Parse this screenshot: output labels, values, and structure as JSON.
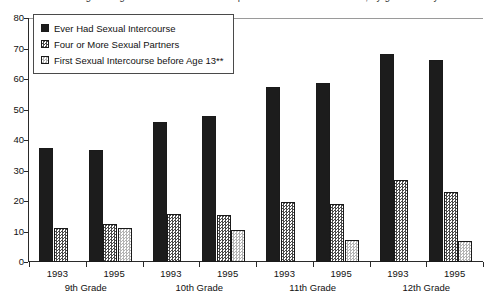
{
  "chart_data": {
    "type": "bar",
    "title": "Percentage of high school students who reported sexual risk behaviors, by grade and year",
    "subtitle": "",
    "xlabel": "",
    "ylabel": "",
    "ylim": [
      0,
      80
    ],
    "yticks": [
      0,
      10,
      20,
      30,
      40,
      50,
      60,
      70,
      80
    ],
    "grid": false,
    "legend_position": "upper-left-inside",
    "categories": [
      "1993 / 9th Grade",
      "1995 / 9th Grade",
      "1993 / 10th Grade",
      "1995 / 10th Grade",
      "1993 / 11th Grade",
      "1995 / 11th Grade",
      "1993 / 12th Grade",
      "1995 / 12th Grade"
    ],
    "series": [
      {
        "name": "Ever Had Sexual Intercourse",
        "color": "#1c1c1c",
        "values": [
          37.5,
          36.8,
          46.0,
          48.0,
          57.5,
          58.6,
          68.3,
          66.3
        ]
      },
      {
        "name": "Four or More Sexual Partners",
        "color": "#4a4a4a",
        "values": [
          11.0,
          12.5,
          15.8,
          15.5,
          19.8,
          19.0,
          27.0,
          22.8
        ]
      },
      {
        "name": "First Sexual Intercourse before Age 13**",
        "color": "#b4b4b4",
        "values": [
          null,
          11.0,
          null,
          10.5,
          null,
          7.2,
          null,
          6.8
        ]
      }
    ],
    "groups": [
      {
        "year": "1993",
        "grade": "9th Grade"
      },
      {
        "year": "1995",
        "grade": "9th Grade"
      },
      {
        "year": "1993",
        "grade": "10th Grade"
      },
      {
        "year": "1995",
        "grade": "10th Grade"
      },
      {
        "year": "1993",
        "grade": "11th Grade"
      },
      {
        "year": "1995",
        "grade": "11th Grade"
      },
      {
        "year": "1993",
        "grade": "12th Grade"
      },
      {
        "year": "1995",
        "grade": "12th Grade"
      }
    ],
    "grade_labels": [
      "9th Grade",
      "10th Grade",
      "11th Grade",
      "12th Grade"
    ],
    "year_labels": [
      "1993",
      "1995",
      "1993",
      "1995",
      "1993",
      "1995",
      "1993",
      "1995"
    ]
  },
  "legend": {
    "items": [
      {
        "label": "Ever Had Sexual Intercourse",
        "swatch": "solid-black-swatch"
      },
      {
        "label": "Four or More Sexual Partners",
        "swatch": "dark-checker-swatch"
      },
      {
        "label": "First Sexual Intercourse before Age 13**",
        "swatch": "light-checker-swatch"
      }
    ]
  },
  "axes": {
    "y_tick_labels": [
      "80",
      "70",
      "60",
      "50",
      "40",
      "30",
      "20",
      "10",
      "0"
    ]
  }
}
